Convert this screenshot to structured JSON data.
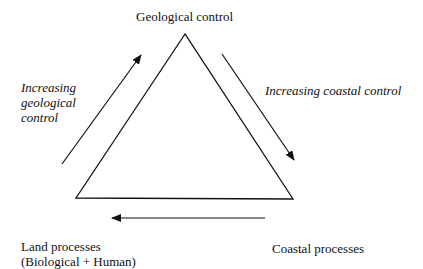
{
  "diagram": {
    "type": "triangle",
    "vertices": {
      "top": {
        "label": "Geological control"
      },
      "bottom_left": {
        "label_line1": "Land processes",
        "label_line2": "(Biological + Human)"
      },
      "bottom_right": {
        "label": "Coastal processes"
      }
    },
    "arrows": {
      "left": {
        "direction": "up-right",
        "label_lines": [
          "Increasing",
          "geological",
          "control"
        ]
      },
      "right": {
        "direction": "down-right",
        "label": "Increasing coastal control"
      },
      "bottom": {
        "direction": "left"
      }
    },
    "colors": {
      "line": "#111111",
      "background": "#ffffff"
    }
  }
}
